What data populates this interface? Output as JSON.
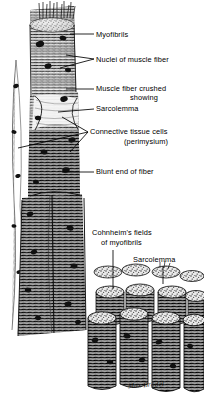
{
  "figure": {
    "background_color": "#ffffff",
    "ink_color": "#000000",
    "width": 204,
    "height": 406
  },
  "labels": [
    {
      "id": "myofibrils",
      "text": "Myofibrils",
      "x": 96,
      "y": 30,
      "align": "left"
    },
    {
      "id": "nuclei",
      "text": "Nuclei of muscle fiber",
      "x": 96,
      "y": 55,
      "align": "left"
    },
    {
      "id": "muscle-fiber-crushed",
      "text": "Muscle fiber crushed",
      "x": 96,
      "y": 85,
      "align": "left"
    },
    {
      "id": "showing",
      "text": "showing",
      "x": 96,
      "y": 94,
      "align": "center",
      "width": 90
    },
    {
      "id": "sarcolemma-top",
      "text": "Sarcolemma",
      "x": 96,
      "y": 105,
      "align": "left"
    },
    {
      "id": "connective-tissue",
      "text": "Connective tissue cells",
      "x": 90,
      "y": 128,
      "align": "left"
    },
    {
      "id": "perimysium",
      "text": "(perimysium)",
      "x": 90,
      "y": 138,
      "align": "center",
      "width": 110
    },
    {
      "id": "blunt-end",
      "text": "Blunt end of fiber",
      "x": 96,
      "y": 168,
      "align": "left"
    },
    {
      "id": "cohnheims-fields",
      "text": "Cohnheim's fields",
      "x": 92,
      "y": 229,
      "align": "left"
    },
    {
      "id": "of-myofibrils",
      "text": "of myofibrils",
      "x": 100,
      "y": 239,
      "align": "left"
    },
    {
      "id": "sarcolemma-bottom",
      "text": "Sarcolemma",
      "x": 133,
      "y": 256,
      "align": "left"
    }
  ],
  "signature": {
    "text": "Max Brödel",
    "x": 128,
    "y": 384
  },
  "structures": [
    {
      "name": "upper-muscle-fiber-cylinder",
      "description": "Cut cylindrical muscle fiber with transverse striations at top of plate"
    },
    {
      "name": "crushed-fiber-segment",
      "description": "Crushed region of fiber showing sarcolemma sheath"
    },
    {
      "name": "perimysium-strand",
      "description": "Connective tissue strand running along left side of fiber"
    },
    {
      "name": "blunt-fiber-end",
      "description": "Blunt terminal end of muscle fiber"
    },
    {
      "name": "fiber-bundle-cluster",
      "description": "Cluster of transversely cut fibers showing Cohnheim's fields"
    }
  ]
}
